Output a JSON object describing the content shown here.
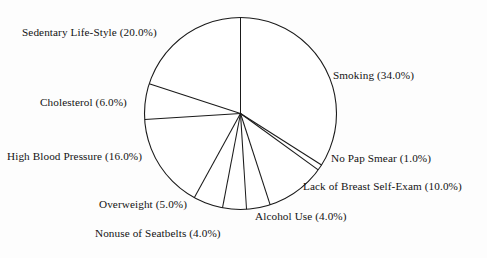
{
  "chart_data": {
    "type": "pie",
    "title": "",
    "subtitle": "",
    "xlabel": "",
    "ylabel": "",
    "legend_position": "none",
    "grid": false,
    "style": "outline",
    "units": "percent",
    "total": 100.0,
    "start_angle_deg": 90,
    "direction": "clockwise",
    "categories": [
      "Smoking",
      "No Pap Smear",
      "Lack of Breast Self-Exam",
      "Alcohol Use",
      "Nonuse of Seatbelts",
      "Overweight",
      "High Blood Pressure",
      "Cholesterol",
      "Sedentary Life-Style"
    ],
    "values": [
      34.0,
      1.0,
      10.0,
      4.0,
      4.0,
      5.0,
      16.0,
      6.0,
      20.0
    ],
    "slices": [
      {
        "label": "Smoking",
        "value": 34.0,
        "text": "Smoking (34.0%)"
      },
      {
        "label": "No Pap Smear",
        "value": 1.0,
        "text": "No Pap Smear (1.0%)"
      },
      {
        "label": "Lack of Breast Self-Exam",
        "value": 10.0,
        "text": "Lack of Breast Self-Exam (10.0%)"
      },
      {
        "label": "Alcohol Use",
        "value": 4.0,
        "text": "Alcohol Use (4.0%)"
      },
      {
        "label": "Nonuse of Seatbelts",
        "value": 4.0,
        "text": "Nonuse of Seatbelts (4.0%)"
      },
      {
        "label": "Overweight",
        "value": 5.0,
        "text": "Overweight (5.0%)"
      },
      {
        "label": "High Blood Pressure",
        "value": 16.0,
        "text": "High Blood Pressure (16.0%)"
      },
      {
        "label": "Cholesterol",
        "value": 6.0,
        "text": "Cholesterol (6.0%)"
      },
      {
        "label": "Sedentary Life-Style",
        "value": 20.0,
        "text": "Sedentary Life-Style (20.0%)"
      }
    ],
    "colors": {
      "stroke": "#1a1a1a",
      "fill": "#ffffff",
      "background": "#fdfdfd",
      "text": "#131313"
    }
  },
  "labels": {
    "smoking": "Smoking (34.0%)",
    "no_pap_smear": "No Pap Smear (1.0%)",
    "lack_of_breast_self_exam": "Lack of Breast Self-Exam (10.0%)",
    "alcohol_use": "Alcohol Use (4.0%)",
    "nonuse_of_seatbelts": "Nonuse of Seatbelts (4.0%)",
    "overweight": "Overweight (5.0%)",
    "high_blood_pressure": "High Blood Pressure (16.0%)",
    "cholesterol": "Cholesterol (6.0%)",
    "sedentary_life_style": "Sedentary Life-Style (20.0%)"
  }
}
